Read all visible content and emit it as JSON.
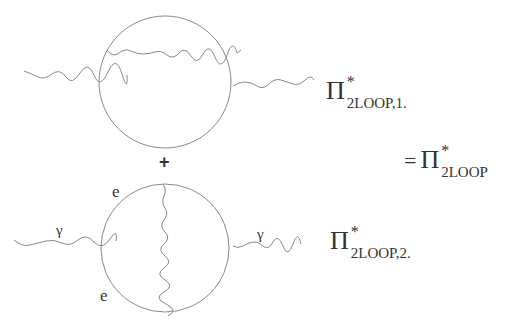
{
  "diagram": {
    "term1": {
      "symbol": "Π",
      "superscript": "*",
      "subscript": "2LOOP,1."
    },
    "term2": {
      "symbol": "Π",
      "superscript": "*",
      "subscript": "2LOOP,2."
    },
    "result": {
      "equals": "=",
      "symbol": "Π",
      "superscript": "*",
      "subscript": "2LOOP"
    },
    "operator": "+",
    "labels": {
      "photon": "γ",
      "electron": "e"
    },
    "colors": {
      "line": "#888888",
      "text": "#333333"
    }
  }
}
